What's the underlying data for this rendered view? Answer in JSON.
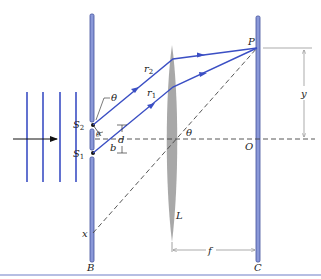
{
  "figure": {
    "colors": {
      "barrier": "#6f7fc8",
      "barrier_edge": "#3f4f9a",
      "ray": "#3b4fc4",
      "wave": "#3b4fc4",
      "lens": "#a6a6a6",
      "dashed": "#444444",
      "dimension": "#888888",
      "rule": "#6f7fc8"
    },
    "labels": {
      "S2": "S",
      "S2_sub": "2",
      "S1": "S",
      "S1_sub": "1",
      "r2": "r",
      "r2_sub": "2",
      "r1": "r",
      "r1_sub": "1",
      "theta_slit": "θ",
      "theta_lens": "θ",
      "theta_angle_small": "θ",
      "b": "b",
      "d": "d",
      "x": "x",
      "L": "L",
      "P": "P",
      "y": "y",
      "O": "O",
      "f": "f",
      "B": "B",
      "C": "C"
    }
  }
}
